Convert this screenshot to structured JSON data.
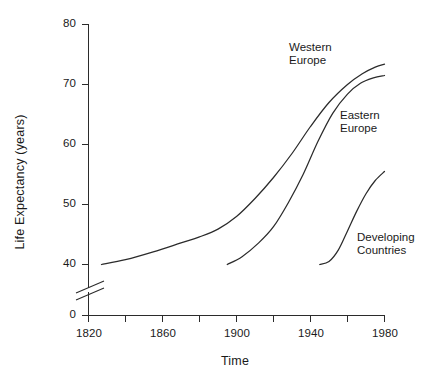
{
  "chart_data": {
    "type": "line",
    "title": "",
    "xlabel": "Time",
    "ylabel": "Life  Expectancy  (years)",
    "xlim": [
      1820,
      1980
    ],
    "ylim": [
      0,
      80
    ],
    "y_axis_break": true,
    "y_axis_break_note": "axis broken between 0 and 40",
    "grid": false,
    "legend_position": "inline-annotations",
    "xticks": [
      1820,
      1840,
      1860,
      1880,
      1900,
      1920,
      1940,
      1960,
      1980
    ],
    "xtick_labels": [
      "1820",
      "",
      "1860",
      "",
      "1900",
      "",
      "1940",
      "",
      "1980"
    ],
    "xtick_labels_shown": [
      "1820",
      "1860",
      "1900",
      "1940",
      "1980"
    ],
    "yticks": [
      0,
      40,
      50,
      60,
      70,
      80
    ],
    "ytick_labels": [
      "0",
      "40",
      "50",
      "60",
      "70",
      "80"
    ],
    "series": [
      {
        "name": "Western Europe",
        "label_lines": "Western\nEurope",
        "x": [
          1827,
          1840,
          1855,
          1870,
          1880,
          1890,
          1900,
          1910,
          1920,
          1930,
          1940,
          1950,
          1960,
          1968,
          1975,
          1980
        ],
        "y": [
          40.0,
          40.8,
          42.1,
          43.6,
          44.6,
          45.9,
          48.0,
          51.0,
          54.5,
          58.5,
          63.0,
          67.0,
          70.0,
          71.8,
          72.9,
          73.4
        ]
      },
      {
        "name": "Eastern Europe",
        "label_lines": "Eastern\nEurope",
        "x": [
          1895,
          1903,
          1912,
          1920,
          1928,
          1936,
          1944,
          1952,
          1960,
          1967,
          1974,
          1980
        ],
        "y": [
          40.0,
          41.3,
          43.6,
          46.3,
          50.3,
          55.0,
          60.5,
          65.2,
          68.4,
          70.2,
          71.1,
          71.5
        ]
      },
      {
        "name": "Developing Countries",
        "label_lines": "Developing\nCountries",
        "x": [
          1945,
          1950,
          1955,
          1960,
          1965,
          1970,
          1975,
          1980
        ],
        "y": [
          40.0,
          40.5,
          42.4,
          45.6,
          48.9,
          51.8,
          54.0,
          55.5
        ]
      }
    ],
    "annotations": [
      {
        "text": "Western\nEurope",
        "for_series": "Western Europe"
      },
      {
        "text": "Eastern\nEurope",
        "for_series": "Eastern Europe"
      },
      {
        "text": "Developing\nCountries",
        "for_series": "Developing Countries"
      }
    ],
    "colors": {
      "line": "#2b2b2b",
      "axis": "#2b2b2b",
      "text": "#1a1a1a",
      "background": "#ffffff"
    }
  },
  "axis": {
    "y_labels": {
      "t80": "80",
      "t70": "70",
      "t60": "60",
      "t50": "50",
      "t40": "40",
      "t0": "0"
    },
    "x_labels": {
      "t1820": "1820",
      "t1860": "1860",
      "t1900": "1900",
      "t1940": "1940",
      "t1980": "1980"
    },
    "y_title": "Life  Expectancy  (years)",
    "x_title": "Time"
  },
  "series_labels": {
    "western_europe": "Western\nEurope",
    "eastern_europe": "Eastern\nEurope",
    "developing_countries": "Developing\nCountries"
  }
}
